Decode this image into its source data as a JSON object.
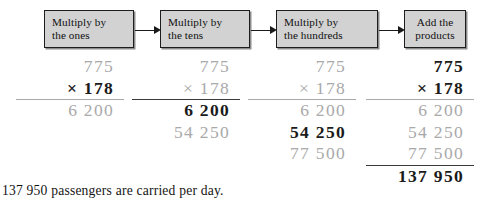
{
  "figure": {
    "title_text": "Long multiplication 775 x 178 shown in four steps",
    "caption": "137 950 passengers are carried per day."
  },
  "flow": {
    "boxes": [
      {
        "name": "multiply-by-ones",
        "line1": "Multiply by",
        "line2": "the ones",
        "align": "left"
      },
      {
        "name": "multiply-by-tens",
        "line1": "Multiply by",
        "line2": "the tens",
        "align": "left"
      },
      {
        "name": "multiply-by-hundreds",
        "line1": "Multiply by",
        "line2": "the hundreds",
        "align": "left"
      },
      {
        "name": "add-the-products",
        "line1": "Add the",
        "line2": "products",
        "align": "center"
      }
    ],
    "arrows": [
      "arrow-1",
      "arrow-2",
      "arrow-3"
    ]
  },
  "colors": {
    "box_fill": "#d2d2d2",
    "box_border": "#1d1d1d",
    "box_shadow": "#8d8d8d",
    "dim_digit": "#a9a9a9",
    "active_digit": "#1b1b1b",
    "rule": "#4a4a4a",
    "page_background": "#ffffff"
  },
  "chart_data": {
    "type": "table",
    "operands": {
      "multiplicand": "775",
      "multiplier": "178",
      "operator": "×"
    },
    "partial_products": [
      "6 200",
      "54 250",
      "77 500"
    ],
    "total": "137 950",
    "steps": [
      {
        "step": 1,
        "label": "Multiply by the ones",
        "highlight": "× 178",
        "rows": [
          {
            "value": "775",
            "state": "dim",
            "rule": false
          },
          {
            "value": "× 178",
            "state": "hot",
            "rule": false
          },
          {
            "value": "6 200",
            "state": "dim",
            "rule": true
          }
        ]
      },
      {
        "step": 2,
        "label": "Multiply by the tens",
        "highlight": "6 200",
        "rows": [
          {
            "value": "775",
            "state": "dim",
            "rule": false
          },
          {
            "value": "× 178",
            "state": "dim",
            "rule": false
          },
          {
            "value": "6 200",
            "state": "hot",
            "rule": true
          },
          {
            "value": "54 250",
            "state": "dim",
            "rule": false
          }
        ]
      },
      {
        "step": 3,
        "label": "Multiply by the hundreds",
        "highlight": "54 250",
        "rows": [
          {
            "value": "775",
            "state": "dim",
            "rule": false
          },
          {
            "value": "× 178",
            "state": "dim",
            "rule": false
          },
          {
            "value": "6 200",
            "state": "dim",
            "rule": true
          },
          {
            "value": "54 250",
            "state": "hot",
            "rule": false
          },
          {
            "value": "77 500",
            "state": "dim",
            "rule": false
          }
        ]
      },
      {
        "step": 4,
        "label": "Add the products",
        "highlight": "137 950",
        "rows": [
          {
            "value": "775",
            "state": "hot",
            "rule": false
          },
          {
            "value": "× 178",
            "state": "hot",
            "rule": false
          },
          {
            "value": "6 200",
            "state": "dim",
            "rule": true
          },
          {
            "value": "54 250",
            "state": "dim",
            "rule": false
          },
          {
            "value": "77 500",
            "state": "dim",
            "rule": false
          },
          {
            "value": "137 950",
            "state": "hot",
            "rule": true
          }
        ]
      }
    ]
  }
}
